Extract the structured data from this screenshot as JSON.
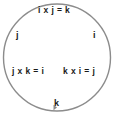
{
  "diagram": {
    "name": "quaternion-cyclic-cross-product-circle",
    "circle": {
      "stroke_color": "#8c8c8c",
      "fill_color": "#ffffff",
      "stroke_width": 1.4
    },
    "arrow": {
      "name": "direction-arrowhead",
      "position": "bottom-center",
      "color": "#8c8c8c"
    },
    "labels": {
      "top_equation": "i x j = k",
      "left_unit": "j",
      "right_unit": "i",
      "bottom_left_equation": "j x k = i",
      "bottom_right_equation": "k x i = j",
      "bottom_unit": "k"
    },
    "text_color": "#1a1a1a"
  }
}
